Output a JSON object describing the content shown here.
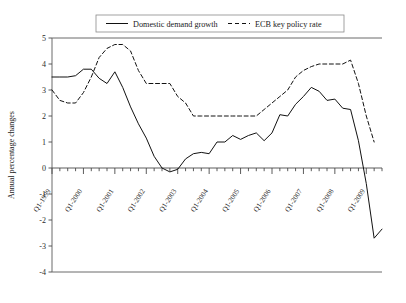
{
  "chart_data": {
    "type": "line",
    "title": "",
    "xlabel": "",
    "ylabel": "Annual percentage changes",
    "ylim": [
      -4,
      5
    ],
    "y_ticks": [
      "5",
      "4",
      "3",
      "2",
      "1",
      "0",
      "-1",
      "-2",
      "-3",
      "-4"
    ],
    "y_tick_values": [
      5,
      4,
      3,
      2,
      1,
      0,
      -1,
      -2,
      -3,
      -4
    ],
    "x_tick_labels": [
      "Q1-1999",
      "Q1-2000",
      "Q1-2001",
      "Q1-2002",
      "Q1-2003",
      "Q1-2004",
      "Q1-2005",
      "Q1-2006",
      "Q1-2007",
      "Q1-2008",
      "Q1-2009"
    ],
    "x_minor_ticks_per_year": 4,
    "grid": false,
    "legend_position": "top",
    "series": [
      {
        "name": "Domestic demand growth",
        "style": "solid",
        "color": "#111111",
        "x": [
          1999.0,
          1999.25,
          1999.5,
          1999.75,
          2000.0,
          2000.25,
          2000.5,
          2000.75,
          2001.0,
          2001.25,
          2001.5,
          2001.75,
          2002.0,
          2002.25,
          2002.5,
          2002.75,
          2003.0,
          2003.25,
          2003.5,
          2003.75,
          2004.0,
          2004.25,
          2004.5,
          2004.75,
          2005.0,
          2005.25,
          2005.5,
          2005.75,
          2006.0,
          2006.25,
          2006.5,
          2006.75,
          2007.0,
          2007.25,
          2007.5,
          2007.75,
          2008.0,
          2008.25,
          2008.5,
          2008.75,
          2009.0,
          2009.25
        ],
        "values": [
          3.5,
          3.5,
          3.5,
          3.55,
          3.8,
          3.8,
          3.45,
          3.25,
          3.7,
          3.1,
          2.35,
          1.7,
          1.15,
          0.45,
          0.0,
          -0.15,
          -0.05,
          0.35,
          0.55,
          0.6,
          0.55,
          1.0,
          1.0,
          1.25,
          1.1,
          1.25,
          1.35,
          1.05,
          1.35,
          2.05,
          2.0,
          2.45,
          2.75,
          3.1,
          2.95,
          2.6,
          2.65,
          2.3,
          2.25,
          1.05,
          -0.6,
          -2.7
        ],
        "endpoint_uptick": -2.35
      },
      {
        "name": "ECB key policy rate",
        "style": "dashed",
        "color": "#111111",
        "x": [
          1999.0,
          1999.25,
          1999.5,
          1999.75,
          2000.0,
          2000.25,
          2000.5,
          2000.75,
          2001.0,
          2001.25,
          2001.5,
          2001.75,
          2002.0,
          2002.25,
          2002.5,
          2002.75,
          2003.0,
          2003.25,
          2003.5,
          2003.75,
          2004.0,
          2004.25,
          2004.5,
          2004.75,
          2005.0,
          2005.25,
          2005.5,
          2005.75,
          2006.0,
          2006.25,
          2006.5,
          2006.75,
          2007.0,
          2007.25,
          2007.5,
          2007.75,
          2008.0,
          2008.25,
          2008.5,
          2008.75,
          2009.0,
          2009.25
        ],
        "values": [
          3.0,
          2.6,
          2.5,
          2.5,
          2.9,
          3.5,
          4.25,
          4.6,
          4.75,
          4.75,
          4.5,
          3.75,
          3.25,
          3.25,
          3.25,
          3.25,
          2.75,
          2.5,
          2.0,
          2.0,
          2.0,
          2.0,
          2.0,
          2.0,
          2.0,
          2.0,
          2.0,
          2.25,
          2.5,
          2.75,
          3.0,
          3.5,
          3.75,
          3.9,
          4.0,
          4.0,
          4.0,
          4.0,
          4.15,
          3.25,
          2.0,
          1.0
        ]
      }
    ],
    "legend": [
      {
        "label": "Domestic demand growth",
        "style": "solid"
      },
      {
        "label": "ECB key policy rate",
        "style": "dashed"
      }
    ]
  }
}
